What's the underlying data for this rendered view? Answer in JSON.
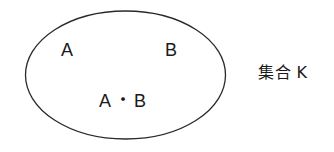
{
  "diagram": {
    "type": "venn-single-set",
    "background_color": "#ffffff",
    "stroke_color": "#2a2a2a",
    "text_color": "#1a1a1a",
    "ellipse": {
      "center_x": 125.5,
      "center_y": 75,
      "radius_x": 100,
      "radius_y": 64,
      "stroke_width": 1.3,
      "fill": "none"
    },
    "labels": {
      "element_a": "A",
      "element_b": "B",
      "intersection_left": "A",
      "intersection_separator": "・",
      "intersection_right": "B",
      "set_name": "集合 K"
    }
  }
}
